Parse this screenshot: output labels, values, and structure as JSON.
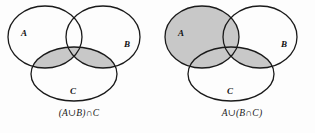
{
  "figure": {
    "background_color": "#fdfdfd",
    "outline_color": "#1a1a1a",
    "shade_color": "#c8c8c8"
  },
  "diagrams": [
    {
      "id": "left",
      "caption": "(A∪B)∩C",
      "caption_plain": "(A union B) intersect C",
      "labels": {
        "a": "A",
        "b": "B",
        "c": "C"
      },
      "shaded_description": "Region of C that overlaps A or B",
      "a_filled": false,
      "bc_lens_filled": true,
      "ac_lens_filled": true
    },
    {
      "id": "right",
      "caption": "A∪(B∩C)",
      "caption_plain": "A union (B intersect C)",
      "labels": {
        "a": "A",
        "b": "B",
        "c": "C"
      },
      "shaded_description": "All of A, plus the overlap of B and C",
      "a_filled": true,
      "bc_lens_filled": true,
      "ac_lens_filled": false
    }
  ],
  "geometry": {
    "circle_a": {
      "cx": 45,
      "cy": 37,
      "rx": 37,
      "ry": 31
    },
    "circle_b": {
      "cx": 103,
      "cy": 37,
      "rx": 37,
      "ry": 31
    },
    "circle_c": {
      "cx": 74,
      "cy": 74,
      "rx": 43,
      "ry": 27
    },
    "label_a": {
      "x": 21,
      "y": 36
    },
    "label_b": {
      "x": 124,
      "y": 47
    },
    "label_c": {
      "x": 70,
      "y": 94
    }
  }
}
